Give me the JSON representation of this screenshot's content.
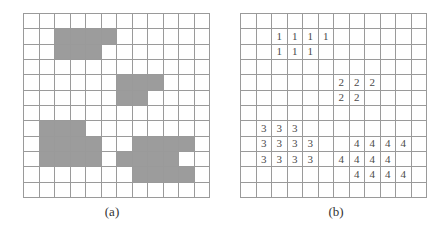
{
  "figure": {
    "rows": 12,
    "cols": 12,
    "shade_color": "#9c9c9c",
    "line_color": "#9a9a9a",
    "panels": [
      {
        "id": "a",
        "caption": "(a)",
        "kind": "binary-image",
        "shaded_cells": [
          [
            1,
            2
          ],
          [
            1,
            3
          ],
          [
            1,
            4
          ],
          [
            1,
            5
          ],
          [
            2,
            2
          ],
          [
            2,
            3
          ],
          [
            2,
            4
          ],
          [
            4,
            6
          ],
          [
            4,
            7
          ],
          [
            4,
            8
          ],
          [
            5,
            6
          ],
          [
            5,
            7
          ],
          [
            7,
            1
          ],
          [
            7,
            2
          ],
          [
            7,
            3
          ],
          [
            8,
            1
          ],
          [
            8,
            2
          ],
          [
            8,
            3
          ],
          [
            8,
            4
          ],
          [
            8,
            7
          ],
          [
            8,
            8
          ],
          [
            8,
            9
          ],
          [
            8,
            10
          ],
          [
            9,
            1
          ],
          [
            9,
            2
          ],
          [
            9,
            3
          ],
          [
            9,
            4
          ],
          [
            9,
            6
          ],
          [
            9,
            7
          ],
          [
            9,
            8
          ],
          [
            9,
            9
          ],
          [
            10,
            7
          ],
          [
            10,
            8
          ],
          [
            10,
            9
          ],
          [
            10,
            10
          ]
        ]
      },
      {
        "id": "b",
        "caption": "(b)",
        "kind": "labeled-components",
        "labeled_cells": [
          {
            "r": 1,
            "c": 2,
            "v": "1"
          },
          {
            "r": 1,
            "c": 3,
            "v": "1"
          },
          {
            "r": 1,
            "c": 4,
            "v": "1"
          },
          {
            "r": 1,
            "c": 5,
            "v": "1"
          },
          {
            "r": 2,
            "c": 2,
            "v": "1"
          },
          {
            "r": 2,
            "c": 3,
            "v": "1"
          },
          {
            "r": 2,
            "c": 4,
            "v": "1"
          },
          {
            "r": 4,
            "c": 6,
            "v": "2"
          },
          {
            "r": 4,
            "c": 7,
            "v": "2"
          },
          {
            "r": 4,
            "c": 8,
            "v": "2"
          },
          {
            "r": 5,
            "c": 6,
            "v": "2"
          },
          {
            "r": 5,
            "c": 7,
            "v": "2"
          },
          {
            "r": 7,
            "c": 1,
            "v": "3"
          },
          {
            "r": 7,
            "c": 2,
            "v": "3"
          },
          {
            "r": 7,
            "c": 3,
            "v": "3"
          },
          {
            "r": 8,
            "c": 1,
            "v": "3"
          },
          {
            "r": 8,
            "c": 2,
            "v": "3"
          },
          {
            "r": 8,
            "c": 3,
            "v": "3"
          },
          {
            "r": 8,
            "c": 4,
            "v": "3"
          },
          {
            "r": 8,
            "c": 7,
            "v": "4"
          },
          {
            "r": 8,
            "c": 8,
            "v": "4"
          },
          {
            "r": 8,
            "c": 9,
            "v": "4"
          },
          {
            "r": 8,
            "c": 10,
            "v": "4"
          },
          {
            "r": 9,
            "c": 1,
            "v": "3"
          },
          {
            "r": 9,
            "c": 2,
            "v": "3"
          },
          {
            "r": 9,
            "c": 3,
            "v": "3"
          },
          {
            "r": 9,
            "c": 4,
            "v": "3"
          },
          {
            "r": 9,
            "c": 6,
            "v": "4"
          },
          {
            "r": 9,
            "c": 7,
            "v": "4"
          },
          {
            "r": 9,
            "c": 8,
            "v": "4"
          },
          {
            "r": 9,
            "c": 9,
            "v": "4"
          },
          {
            "r": 10,
            "c": 7,
            "v": "4"
          },
          {
            "r": 10,
            "c": 8,
            "v": "4"
          },
          {
            "r": 10,
            "c": 9,
            "v": "4"
          },
          {
            "r": 10,
            "c": 10,
            "v": "4"
          }
        ]
      }
    ]
  }
}
